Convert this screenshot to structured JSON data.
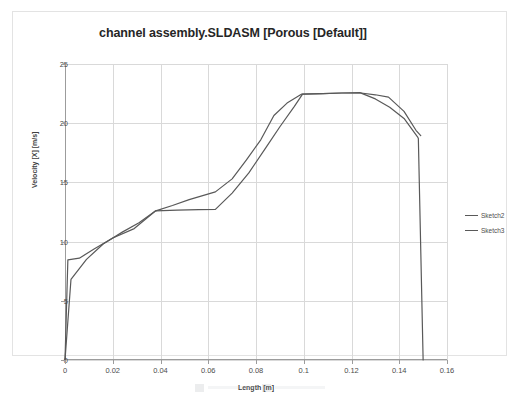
{
  "chart": {
    "title": "channel assembly.SLDASM [Porous [Default]]",
    "legend": {
      "position": "right",
      "entries": [
        {
          "label": "Sketch2",
          "color": "#595959"
        },
        {
          "label": "Sketch3",
          "color": "#595959"
        }
      ]
    }
  },
  "chart_data": {
    "type": "line",
    "title": "channel assembly.SLDASM [Porous [Default]]",
    "xlabel": "Length [m]",
    "ylabel": "Velocity [X] [m/s]",
    "xlim": [
      0,
      0.16
    ],
    "ylim": [
      0,
      25
    ],
    "xticks": [
      0,
      0.02,
      0.04,
      0.06,
      0.08,
      0.1,
      0.12,
      0.14,
      0.16
    ],
    "xtick_labels": [
      "0",
      "0.02",
      "0.04",
      "0.06",
      "0.08",
      "0.1",
      "0.12",
      "0.14",
      "0.16"
    ],
    "yticks": [
      0,
      5,
      10,
      15,
      20,
      25
    ],
    "ytick_labels": [
      "0",
      "5",
      "10",
      "15",
      "20",
      "25"
    ],
    "grid": true,
    "series": [
      {
        "name": "Sketch2",
        "color": "#595959",
        "x": [
          0.0,
          0.0012,
          0.006,
          0.012,
          0.02,
          0.029,
          0.038,
          0.045,
          0.052,
          0.063,
          0.07,
          0.076,
          0.082,
          0.0875,
          0.093,
          0.099,
          0.108,
          0.116,
          0.124,
          0.13,
          0.1355,
          0.142,
          0.147,
          0.149
        ],
        "y": [
          0.0,
          8.45,
          8.6,
          9.35,
          10.3,
          11.1,
          12.6,
          13.05,
          13.55,
          14.2,
          15.3,
          16.9,
          18.6,
          20.65,
          21.7,
          22.45,
          22.5,
          22.55,
          22.55,
          22.4,
          22.2,
          21.0,
          19.4,
          18.95
        ]
      },
      {
        "name": "Sketch3",
        "color": "#595959",
        "x": [
          0.0,
          0.0025,
          0.009,
          0.016,
          0.024,
          0.031,
          0.038,
          0.047,
          0.056,
          0.063,
          0.07,
          0.077,
          0.084,
          0.09,
          0.096,
          0.0995,
          0.108,
          0.116,
          0.1235,
          0.13,
          0.136,
          0.142,
          0.1478,
          0.148,
          0.15,
          0.15
        ],
        "y": [
          0.0,
          6.8,
          8.5,
          9.8,
          10.8,
          11.6,
          12.6,
          12.65,
          12.7,
          12.72,
          14.1,
          15.8,
          17.9,
          19.7,
          21.4,
          22.45,
          22.5,
          22.55,
          22.58,
          22.05,
          21.35,
          20.4,
          18.8,
          18.7,
          0.0,
          0.0
        ]
      }
    ]
  }
}
